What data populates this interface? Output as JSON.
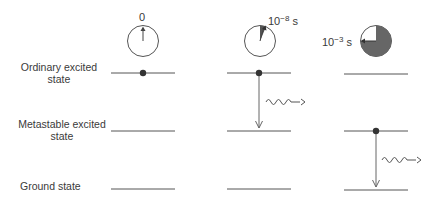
{
  "states": [
    {
      "id": "ordinary",
      "label_line1": "Ordinary excited",
      "label_line2": "state",
      "y": 73
    },
    {
      "id": "metastable",
      "label_line1": "Metastable excited",
      "label_line2": "state",
      "y": 131
    },
    {
      "id": "ground",
      "label_line1": "Ground state",
      "label_line2": "",
      "y": 189
    }
  ],
  "columns": [
    {
      "clock_label": "0",
      "clock_fill_fraction": 0,
      "electron_level": "ordinary",
      "transition": null
    },
    {
      "clock_label_base": "10",
      "clock_label_exp": "−8",
      "clock_label_unit": "s",
      "clock_fill_fraction": 0.05,
      "electron_level": "ordinary",
      "transition": "ordinary-to-metastable"
    },
    {
      "clock_label_base": "10",
      "clock_label_exp": "−3",
      "clock_label_unit": "s",
      "clock_fill_fraction": 0.75,
      "electron_level": "metastable",
      "transition": "metastable-to-ground"
    }
  ],
  "colors": {
    "line": "#555555",
    "fill": "#666666",
    "text": "#3a3a3a"
  }
}
